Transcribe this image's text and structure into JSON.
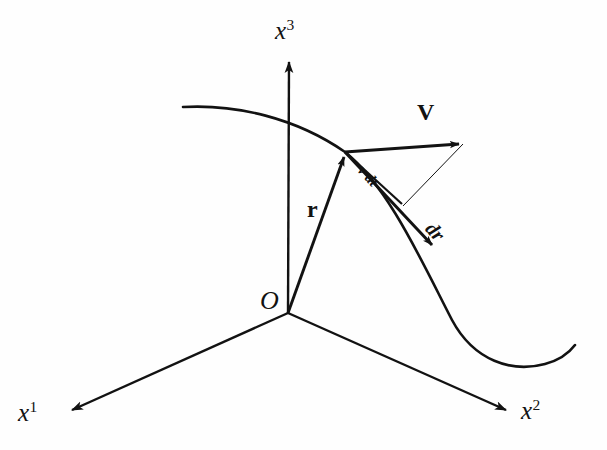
{
  "figure": {
    "background_color": "#fefefe",
    "ink_color": "#121212",
    "width": 607,
    "height": 450
  },
  "axes": {
    "x1": {
      "label_base": "x",
      "label_sup": "1",
      "name": "x1-axis",
      "tip": [
        68,
        412
      ],
      "origin": [
        288,
        313
      ]
    },
    "x2": {
      "label_base": "x",
      "label_sup": "2",
      "name": "x2-axis",
      "tip": [
        510,
        412
      ],
      "origin": [
        288,
        313
      ]
    },
    "x3": {
      "label_base": "x",
      "label_sup": "3",
      "name": "x3-axis",
      "tip": [
        289,
        58
      ],
      "origin": [
        288,
        313
      ]
    }
  },
  "origin": {
    "label": "O",
    "point": [
      288,
      313
    ]
  },
  "vectors": {
    "r": {
      "label": "r",
      "style": "bold",
      "from": [
        288,
        313
      ],
      "to": [
        345,
        153
      ]
    },
    "V": {
      "label": "V",
      "style": "bold",
      "from": [
        345,
        152
      ],
      "to": [
        463,
        144
      ]
    },
    "dr": {
      "label": "dr",
      "style": "bold-italic",
      "from": [
        345,
        152
      ],
      "to": [
        436,
        249
      ]
    },
    "v_dt": {
      "label": "v·dt",
      "style": "bold-italic-small",
      "from": [
        345,
        152
      ],
      "to": [
        404,
        206
      ]
    }
  },
  "construction_line": {
    "name": "thin-connector",
    "from": [
      463,
      144
    ],
    "to": [
      404,
      206
    ]
  },
  "trajectory": {
    "name": "trajectory-curve",
    "description": "smooth curve passing through the tip of r, dipping down to the right then rising",
    "points": [
      [
        183,
        107
      ],
      [
        250,
        110
      ],
      [
        310,
        130
      ],
      [
        345,
        152
      ],
      [
        400,
        225
      ],
      [
        445,
        312
      ],
      [
        490,
        360
      ],
      [
        535,
        365
      ],
      [
        575,
        345
      ]
    ]
  }
}
